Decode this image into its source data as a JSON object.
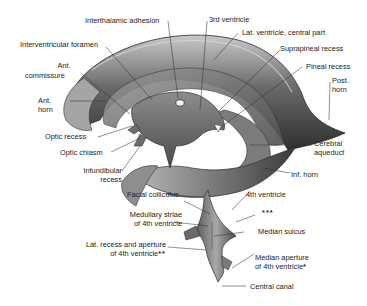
{
  "figure": {
    "colors": {
      "background": "#ffffff",
      "cast_dark": "#3d3d3d",
      "cast_mid": "#7a7a7a",
      "cast_light": "#bdbdbd",
      "leader_line": "#333333",
      "text": "#222222"
    }
  },
  "labels": {
    "interthalamic_adhesion": "Interthalamic adhesion",
    "third_ventricle": "3rd ventricle",
    "interventricular_foramen": "Interventricular foramen",
    "lat_ventricle_central": "Lat. ventricle, central part",
    "suprapineal_recess": "Suprapineal recess",
    "ant_commissure_1": "Ant.",
    "ant_commissure_2": "commissure",
    "pineal_recess": "Pineal recess",
    "post_horn_1": "Post.",
    "post_horn_2": "horn",
    "ant_horn_1": "Ant.",
    "ant_horn_2": "horn",
    "optic_recess": "Optic recess",
    "optic_chiasm": "Optic chiasm",
    "cerebral_aqueduct_1": "Cerebral",
    "cerebral_aqueduct_2": "aqueduct",
    "infundibular_recess_1": "Infundibular",
    "infundibular_recess_2": "recess",
    "inf_horn": "Inf. horn",
    "facial_colliculus": "Facial colliculus",
    "fourth_ventricle": "4th ventricle",
    "triple_star": "***",
    "medullary_striae_1": "Medullary striae",
    "medullary_striae_2": "of 4th ventricle",
    "median_sulcus": "Median sulcus",
    "lat_recess_1": "Lat. recess and aperture",
    "lat_recess_2": "of 4th ventricle",
    "lat_recess_mark": "**",
    "median_aperture_1": "Median aperture",
    "median_aperture_2": "of 4th ventricle",
    "median_aperture_mark": "*",
    "central_canal": "Central canal"
  }
}
